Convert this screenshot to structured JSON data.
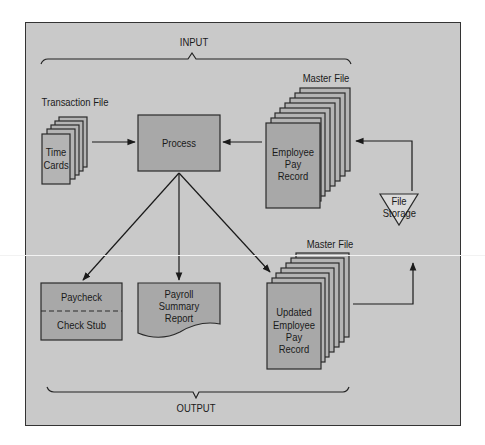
{
  "diagram": {
    "type": "flowchart",
    "colors": {
      "background": "#c9c9c9",
      "box_fill": "#a8a8a8",
      "storage_fill": "#d9d9d9",
      "stroke": "#2a2a2a"
    },
    "sections": {
      "input_label": "INPUT",
      "output_label": "OUTPUT"
    },
    "nodes": {
      "transaction_file_label": "Transaction File",
      "time_cards": "Time Cards",
      "time_cards_line1": "Time",
      "time_cards_line2": "Cards",
      "process": "Process",
      "master_file_top_label": "Master File",
      "employee_pay_record": [
        "Employee",
        "Pay",
        "Record"
      ],
      "file_storage": [
        "File",
        "Storage"
      ],
      "master_file_bottom_label": "Master File",
      "updated_employee_pay_record": [
        "Updated",
        "Employee",
        "Pay",
        "Record"
      ],
      "paycheck": "Paycheck",
      "check_stub": "Check Stub",
      "payroll_summary_report": [
        "Payroll",
        "Summary",
        "Report"
      ]
    },
    "edges": [
      {
        "from": "Time Cards",
        "to": "Process"
      },
      {
        "from": "Employee Pay Record",
        "to": "Process"
      },
      {
        "from": "Process",
        "to": "Paycheck"
      },
      {
        "from": "Process",
        "to": "Payroll Summary Report"
      },
      {
        "from": "Process",
        "to": "Updated Employee Pay Record"
      },
      {
        "from": "Updated Employee Pay Record",
        "to": "File Storage"
      },
      {
        "from": "File Storage",
        "to": "Employee Pay Record"
      }
    ]
  }
}
